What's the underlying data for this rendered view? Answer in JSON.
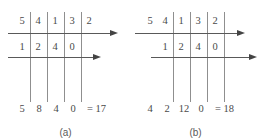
{
  "figure": {
    "diagrams": [
      {
        "id": "a",
        "caption": "(a)",
        "top_row": [
          "5",
          "4",
          "1",
          "3",
          "2"
        ],
        "middle_row": [
          "1",
          "2",
          "4",
          "0"
        ],
        "result_row": [
          "5",
          "8",
          "4",
          "0"
        ],
        "equals_text": "= 17"
      },
      {
        "id": "b",
        "caption": "(b)",
        "top_row": [
          "5",
          "4",
          "1",
          "3",
          "2"
        ],
        "middle_row": [
          "1",
          "2",
          "4",
          "0"
        ],
        "result_row": [
          "4",
          "2",
          "12",
          "0"
        ],
        "equals_text": "= 18"
      }
    ],
    "colors": {
      "vertical_line": "#8f8f8f",
      "horizontal_line": "#595959",
      "arrow": "#444444",
      "digit_text": "#4a4a4a",
      "caption_text": "#5a5a5a",
      "background": "#ffffff"
    }
  }
}
